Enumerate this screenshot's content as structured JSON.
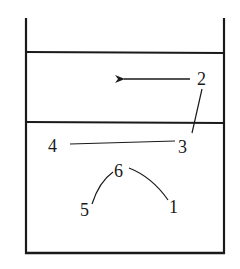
{
  "diagram": {
    "labels": {
      "l1": "1",
      "l2": "2",
      "l3": "3",
      "l4": "4",
      "l5": "5",
      "l6": "6"
    },
    "colors": {
      "stroke": "#1a1a1a",
      "background": "#ffffff"
    },
    "arrow_direction": "left"
  }
}
